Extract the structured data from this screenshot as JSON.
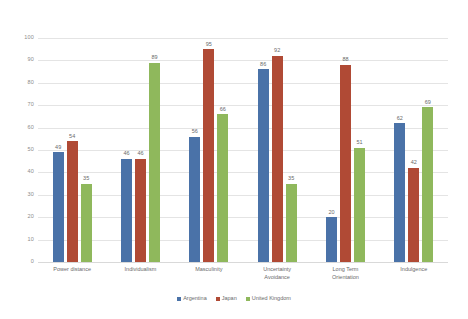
{
  "chart_data": {
    "type": "bar",
    "title": "",
    "subtitle": "",
    "xlabel": "",
    "ylabel": "",
    "ylim": [
      0,
      100
    ],
    "yticks": [
      0,
      10,
      20,
      30,
      40,
      50,
      60,
      70,
      80,
      90,
      100
    ],
    "grid": true,
    "legend_position": "bottom",
    "categories": [
      "Power distance",
      "Individualism",
      "Masculinity",
      "Uncertainty\nAvoidance",
      "Long Term\nOrientation",
      "Indulgence"
    ],
    "series": [
      {
        "name": "Argentina",
        "color": "#4a72a8",
        "values": [
          49,
          46,
          56,
          86,
          20,
          62
        ]
      },
      {
        "name": "Japan",
        "color": "#b04a35",
        "values": [
          54,
          46,
          95,
          92,
          88,
          42
        ]
      },
      {
        "name": "United Kingdom",
        "color": "#8fb85c",
        "values": [
          35,
          89,
          66,
          35,
          51,
          69
        ]
      }
    ]
  },
  "colors": {
    "series_argentina": "#4a72a8",
    "series_japan": "#b04a35",
    "series_united_kingdom": "#8fb85c",
    "gridline": "#e4e4e4",
    "axis_text": "#8c8c8c",
    "label_text": "#6a6a6a",
    "background": "#ffffff"
  }
}
